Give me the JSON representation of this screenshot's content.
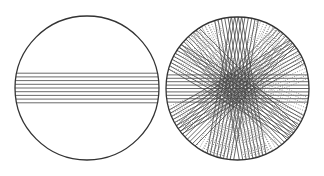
{
  "figure": {
    "colors": {
      "background": "#ffffff",
      "circle_stroke": "#333333",
      "chord_stroke": "#444444",
      "dotted_stroke": "#777777"
    },
    "left_panel": {
      "chord_count": 9,
      "bundles": [
        {
          "angle_deg": 0,
          "style": "solid"
        }
      ]
    },
    "right_panel": {
      "chord_count_per_bundle": 9,
      "bundles": [
        {
          "angle_deg": 0,
          "style": "solid"
        },
        {
          "angle_deg": 22.5,
          "style": "dotted"
        },
        {
          "angle_deg": 45,
          "style": "solid"
        },
        {
          "angle_deg": 67.5,
          "style": "dotted"
        },
        {
          "angle_deg": 80,
          "style": "solid"
        },
        {
          "angle_deg": 100,
          "style": "solid"
        },
        {
          "angle_deg": 112.5,
          "style": "dotted"
        },
        {
          "angle_deg": 135,
          "style": "solid"
        },
        {
          "angle_deg": 157.5,
          "style": "dotted"
        },
        {
          "angle_deg": 150,
          "style": "solid"
        },
        {
          "angle_deg": 30,
          "style": "solid"
        },
        {
          "angle_deg": 60,
          "style": "dotted"
        },
        {
          "angle_deg": 120,
          "style": "dotted"
        }
      ]
    }
  }
}
